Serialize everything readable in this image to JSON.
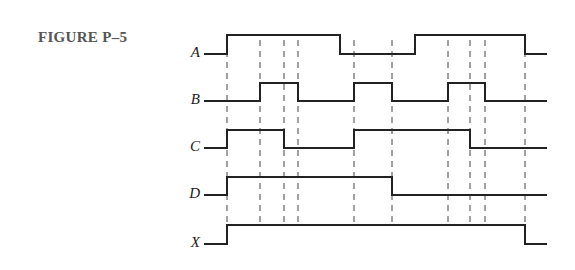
{
  "figure": {
    "label": "FIGURE P–5"
  },
  "diagram": {
    "type": "timing-diagram",
    "x_start": 204,
    "x_end": 547,
    "edges": [
      227,
      260,
      284,
      298,
      340,
      354,
      392,
      415,
      448,
      470,
      485,
      525
    ],
    "dashed_guides": [
      227,
      260,
      284,
      298,
      354,
      392,
      448,
      470,
      485,
      525
    ],
    "dash_top": 40,
    "dash_bottom": 225,
    "signals": [
      {
        "name": "A",
        "low_y": 54,
        "high_y": 35,
        "initial": 0,
        "transitions": [
          227,
          340,
          415,
          525
        ]
      },
      {
        "name": "B",
        "low_y": 101,
        "high_y": 83,
        "initial": 0,
        "transitions": [
          260,
          298,
          354,
          392,
          448,
          485
        ]
      },
      {
        "name": "C",
        "low_y": 148,
        "high_y": 130,
        "initial": 0,
        "transitions": [
          227,
          284,
          354,
          470
        ]
      },
      {
        "name": "D",
        "low_y": 195,
        "high_y": 177,
        "initial": 0,
        "transitions": [
          227,
          392
        ]
      },
      {
        "name": "X",
        "low_y": 244,
        "high_y": 225,
        "initial": 0,
        "transitions": [
          227,
          525
        ]
      }
    ],
    "stroke_color": "#222222",
    "dash_color": "#444444"
  }
}
